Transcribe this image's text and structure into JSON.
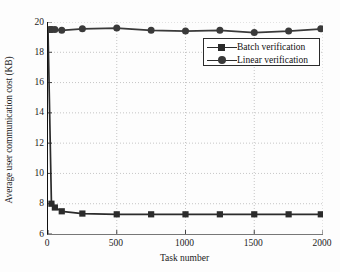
{
  "chart_data": {
    "type": "line",
    "title": "",
    "xlabel": "Task number",
    "ylabel": "Average user communication cost (KB)",
    "xlim": [
      0,
      2000
    ],
    "ylim": [
      6,
      20
    ],
    "xticks": [
      0,
      500,
      1000,
      1500,
      2000
    ],
    "yticks": [
      6,
      8,
      10,
      12,
      14,
      16,
      18,
      20
    ],
    "grid": true,
    "legend_position": "upper right",
    "x": [
      0,
      25,
      50,
      100,
      250,
      500,
      750,
      1000,
      1250,
      1500,
      1750,
      2000
    ],
    "series": [
      {
        "name": "Batch verification",
        "marker": "square",
        "color": "#2b2b2b",
        "values": [
          19.5,
          8.0,
          7.75,
          7.5,
          7.35,
          7.3,
          7.3,
          7.3,
          7.3,
          7.3,
          7.3,
          7.3
        ]
      },
      {
        "name": "Linear verification",
        "marker": "circle",
        "color": "#3a3a3a",
        "values": [
          19.5,
          19.5,
          19.5,
          19.45,
          19.55,
          19.6,
          19.45,
          19.4,
          19.45,
          19.3,
          19.4,
          19.55
        ]
      }
    ]
  },
  "legend": {
    "entries": [
      {
        "label": "Batch verification",
        "marker": "square-marker-icon"
      },
      {
        "label": "Linear verification",
        "marker": "circle-marker-icon"
      }
    ]
  },
  "yticks_labels": [
    "20",
    "18",
    "16",
    "14",
    "12",
    "10",
    "8",
    "6"
  ],
  "xticks_labels": [
    "0",
    "500",
    "1000",
    "1500",
    "2000"
  ]
}
